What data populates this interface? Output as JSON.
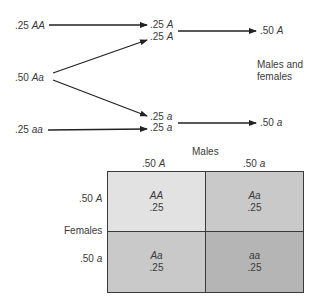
{
  "top": {
    "parents": [
      {
        "freq": ".25",
        "genotype": "AA"
      },
      {
        "freq": ".50",
        "genotype": "Aa"
      },
      {
        "freq": ".25",
        "genotype": "aa"
      }
    ],
    "gametes": [
      {
        "freq": ".25",
        "allele": "A"
      },
      {
        "freq": ".25",
        "allele": "A"
      },
      {
        "freq": ".25",
        "allele": "a"
      },
      {
        "freq": ".25",
        "allele": "a"
      }
    ],
    "pooled": [
      {
        "freq": ".50",
        "allele": "A"
      },
      {
        "freq": ".50",
        "allele": "a"
      }
    ],
    "pool_label_line1": "Males and",
    "pool_label_line2": "females"
  },
  "punnett": {
    "males_label": "Males",
    "females_label": "Females",
    "columns": [
      {
        "freq": ".50",
        "allele": "A"
      },
      {
        "freq": ".50",
        "allele": "a"
      }
    ],
    "rows": [
      {
        "freq": ".50",
        "allele": "A"
      },
      {
        "freq": ".50",
        "allele": "a"
      }
    ],
    "cells": [
      {
        "genotype": "AA",
        "freq": ".25",
        "color": "#e2e2e2"
      },
      {
        "genotype": "Aa",
        "freq": ".25",
        "color": "#c9c9c9"
      },
      {
        "genotype": "Aa",
        "freq": ".25",
        "color": "#c9c9c9"
      },
      {
        "genotype": "aa",
        "freq": ".25",
        "color": "#b5b5b5"
      }
    ]
  },
  "colors": {
    "line": "#222222",
    "text": "#3a3a3a"
  }
}
